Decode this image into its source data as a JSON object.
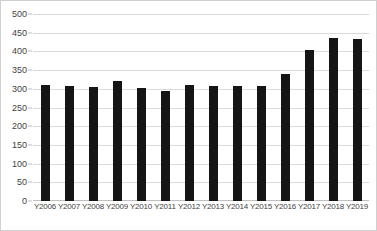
{
  "chart_data": {
    "type": "bar",
    "title": "",
    "xlabel": "",
    "ylabel": "",
    "categories": [
      "Y2006",
      "Y2007",
      "Y2008",
      "Y2009",
      "Y2010",
      "Y2011",
      "Y2012",
      "Y2013",
      "Y2014",
      "Y2015",
      "Y2016",
      "Y2017",
      "Y2018",
      "Y2019"
    ],
    "values": [
      310,
      308,
      305,
      320,
      303,
      295,
      310,
      308,
      307,
      307,
      340,
      405,
      435,
      433
    ],
    "ylim": [
      0,
      500
    ],
    "yticks": [
      0,
      50,
      100,
      150,
      200,
      250,
      300,
      350,
      400,
      450,
      500
    ],
    "ytick_labels": [
      "0",
      "50",
      "100",
      "150",
      "200",
      "250",
      "300",
      "350",
      "400",
      "450",
      "500"
    ],
    "grid": true,
    "legend": false,
    "series": [
      {
        "name": "",
        "values": [
          310,
          308,
          305,
          320,
          303,
          295,
          310,
          308,
          307,
          307,
          340,
          405,
          435,
          433
        ]
      }
    ],
    "colors": {
      "bar": "#151515",
      "gridline": "#d9d9d9",
      "axis": "#bfbfbf",
      "tick_text": "#3f3f3f",
      "background": "#ffffff",
      "border": "#d0d0d0"
    }
  }
}
